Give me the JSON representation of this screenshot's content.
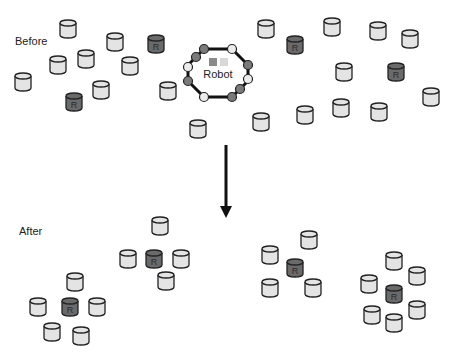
{
  "labels": {
    "before": "Before",
    "after": "After",
    "robot": "Robot",
    "puck_mark": "R"
  },
  "colors": {
    "puck_fill": "#e4e4e4",
    "puck_dark_fill": "#6a6a6a",
    "stroke": "#222222",
    "robot_stroke": "#111111",
    "sensor_dark": "#7a7a7a",
    "sensor_light": "#ececec",
    "indicator_dark": "#8a8a8a",
    "indicator_light": "#d8d8d8"
  },
  "pucks_before": [
    {
      "x": 60,
      "y": 20,
      "r": false
    },
    {
      "x": 107,
      "y": 33,
      "r": false
    },
    {
      "x": 148,
      "y": 35,
      "r": true
    },
    {
      "x": 50,
      "y": 56,
      "r": false
    },
    {
      "x": 78,
      "y": 50,
      "r": false
    },
    {
      "x": 122,
      "y": 57,
      "r": false
    },
    {
      "x": 15,
      "y": 73,
      "r": false
    },
    {
      "x": 93,
      "y": 81,
      "r": false
    },
    {
      "x": 66,
      "y": 93,
      "r": true
    },
    {
      "x": 160,
      "y": 82,
      "r": false
    },
    {
      "x": 190,
      "y": 120,
      "r": false
    },
    {
      "x": 258,
      "y": 20,
      "r": false
    },
    {
      "x": 287,
      "y": 36,
      "r": true
    },
    {
      "x": 324,
      "y": 18,
      "r": false
    },
    {
      "x": 370,
      "y": 22,
      "r": false
    },
    {
      "x": 402,
      "y": 30,
      "r": false
    },
    {
      "x": 336,
      "y": 63,
      "r": false
    },
    {
      "x": 388,
      "y": 63,
      "r": true
    },
    {
      "x": 423,
      "y": 88,
      "r": false
    },
    {
      "x": 253,
      "y": 113,
      "r": false
    },
    {
      "x": 297,
      "y": 106,
      "r": false
    },
    {
      "x": 333,
      "y": 99,
      "r": false
    },
    {
      "x": 371,
      "y": 103,
      "r": false
    }
  ],
  "pucks_after": [
    {
      "x": 152,
      "y": 217,
      "r": false
    },
    {
      "x": 120,
      "y": 250,
      "r": false
    },
    {
      "x": 146,
      "y": 250,
      "r": true
    },
    {
      "x": 173,
      "y": 250,
      "r": false
    },
    {
      "x": 158,
      "y": 272,
      "r": false
    },
    {
      "x": 67,
      "y": 273,
      "r": false
    },
    {
      "x": 30,
      "y": 298,
      "r": false
    },
    {
      "x": 62,
      "y": 298,
      "r": true
    },
    {
      "x": 89,
      "y": 298,
      "r": false
    },
    {
      "x": 44,
      "y": 323,
      "r": false
    },
    {
      "x": 73,
      "y": 327,
      "r": false
    },
    {
      "x": 301,
      "y": 231,
      "r": false
    },
    {
      "x": 262,
      "y": 246,
      "r": false
    },
    {
      "x": 287,
      "y": 259,
      "r": true
    },
    {
      "x": 305,
      "y": 279,
      "r": false
    },
    {
      "x": 262,
      "y": 279,
      "r": false
    },
    {
      "x": 386,
      "y": 252,
      "r": false
    },
    {
      "x": 409,
      "y": 267,
      "r": false
    },
    {
      "x": 361,
      "y": 275,
      "r": false
    },
    {
      "x": 386,
      "y": 285,
      "r": true
    },
    {
      "x": 409,
      "y": 301,
      "r": false
    },
    {
      "x": 364,
      "y": 306,
      "r": false
    },
    {
      "x": 386,
      "y": 314,
      "r": false
    }
  ],
  "robot": {
    "cx": 218,
    "cy": 73
  },
  "arrow": {
    "x": 226,
    "y1": 145,
    "y2": 218
  }
}
